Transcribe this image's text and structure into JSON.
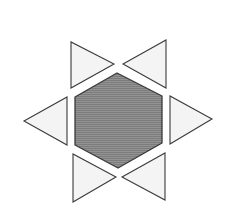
{
  "figure": {
    "colors": {
      "background": "#ffffff",
      "hexagon_fill": "#8e8e8e",
      "hexagon_stripe": "#7a7a7a",
      "triangle_fill": "#f4f4f4",
      "stroke": "#3a3a3a"
    },
    "hexagon": {
      "points": "117,73 162,96 162,143 118,168 75,145 75,97"
    },
    "triangles": [
      {
        "name": "top-left",
        "points": "71,42 71,88 114,64"
      },
      {
        "name": "top-right",
        "points": "166,40 166,88 123,64"
      },
      {
        "name": "left",
        "points": "67,97 67,145 24,121"
      },
      {
        "name": "right",
        "points": "170,96 170,144 212,119"
      },
      {
        "name": "bottom-left",
        "points": "73,154 73,202 116,177"
      },
      {
        "name": "bottom-right",
        "points": "165,153 165,200 122,177"
      }
    ]
  }
}
